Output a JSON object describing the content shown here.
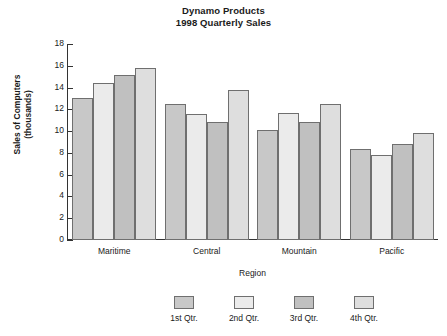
{
  "chart_data": {
    "type": "bar",
    "title": "Dynamo Products",
    "subtitle": "1998 Quarterly Sales",
    "xlabel": "Region",
    "ylabel": "Sales of Computers",
    "ylabel_line2": "(thousands)",
    "categories": [
      "Maritime",
      "Central",
      "Mountain",
      "Pacific"
    ],
    "series": [
      {
        "name": "1st Qtr.",
        "values": [
          13.0,
          12.5,
          10.1,
          8.4
        ],
        "color": "#c8c8c8"
      },
      {
        "name": "2nd Qtr.",
        "values": [
          14.4,
          11.6,
          11.7,
          7.8
        ],
        "color": "#ebebeb"
      },
      {
        "name": "3rd Qtr.",
        "values": [
          15.2,
          10.8,
          10.8,
          8.8
        ],
        "color": "#c0c0c0"
      },
      {
        "name": "4th Qtr.",
        "values": [
          15.8,
          13.8,
          12.5,
          9.8
        ],
        "color": "#dedede"
      }
    ],
    "ylim": [
      0,
      18
    ],
    "yticks": [
      0,
      2,
      4,
      6,
      8,
      10,
      12,
      14,
      16,
      18
    ],
    "ytick_labels": [
      "0",
      "2",
      "4",
      "6",
      "8",
      "10",
      "12",
      "14",
      "16",
      "18"
    ],
    "grid": false,
    "legend_position": "bottom",
    "legend_entries": [
      "1st Qtr.",
      "2nd Qtr.",
      "3rd Qtr.",
      "4th Qtr."
    ],
    "axis_color": "#333333",
    "bar_border_color": "#6f6f6f",
    "background": "#ffffff"
  }
}
